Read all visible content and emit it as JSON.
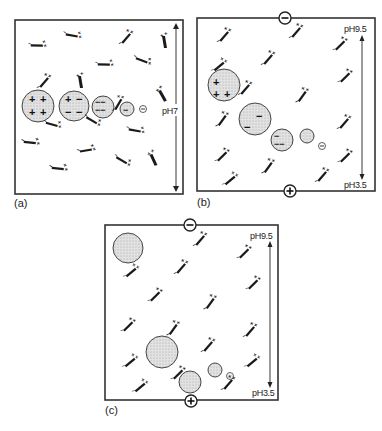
{
  "figure": {
    "type": "isoelectric-focusing-schematic",
    "panels": [
      {
        "id": "a",
        "label": "(a)",
        "ph_label": "pH7",
        "description": "uniform pH 7 with charged proteins and ampholytes",
        "proteins": [
          {
            "charges": "+ + + +",
            "size": "large"
          },
          {
            "charges": "+ − − −",
            "size": "large"
          },
          {
            "charges": "− − − −",
            "size": "medium"
          },
          {
            "charges": "−",
            "size": "small"
          },
          {
            "charges": "⊖",
            "size": "ion"
          }
        ]
      },
      {
        "id": "b",
        "label": "(b)",
        "ph_top": "pH9.5",
        "ph_bottom": "pH3.5",
        "electrode_top": "−",
        "electrode_bottom": "+",
        "ion": "⊖"
      },
      {
        "id": "c",
        "label": "(c)",
        "ph_top": "pH9.5",
        "ph_bottom": "pH3.5",
        "electrode_top": "−",
        "electrode_bottom": "+"
      }
    ],
    "colors": {
      "protein_fill": "#dcdcdc",
      "outline": "#333333",
      "ampholyte": "#1a1a1a"
    }
  }
}
